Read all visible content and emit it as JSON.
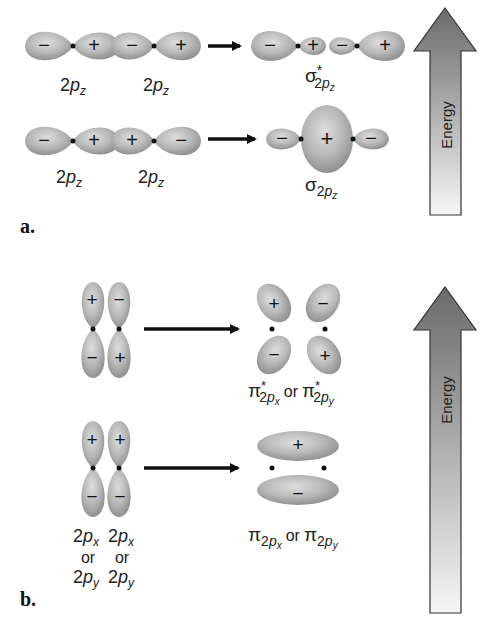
{
  "figure": {
    "colors": {
      "lobe_fill_light": "#dcdcdc",
      "lobe_fill_mid": "#b4b4b4",
      "lobe_fill_dark": "#8e8e8e",
      "nucleus": "#111111",
      "arrow": "#111111",
      "energy_top": "#6e6e6e",
      "energy_bottom": "#f4f4f4",
      "energy_outline": "#333333"
    },
    "panel_a": {
      "label": "a.",
      "antibonding": {
        "atomic_orbitals": [
          {
            "label_main": "2",
            "label_italic": "p",
            "label_sub": "z",
            "lobes": [
              "−",
              "+"
            ]
          },
          {
            "label_main": "2",
            "label_italic": "p",
            "label_sub": "z",
            "lobes": [
              "−",
              "+"
            ]
          }
        ],
        "molecular_orbital": {
          "symbol": "σ",
          "superscript": "*",
          "sub_main": "2",
          "sub_italic": "p",
          "sub_sub": "z",
          "lobes": [
            "−",
            "+",
            "−",
            "+"
          ]
        }
      },
      "bonding": {
        "atomic_orbitals": [
          {
            "label_main": "2",
            "label_italic": "p",
            "label_sub": "z",
            "lobes": [
              "−",
              "+"
            ]
          },
          {
            "label_main": "2",
            "label_italic": "p",
            "label_sub": "z",
            "lobes": [
              "+",
              "−"
            ]
          }
        ],
        "molecular_orbital": {
          "symbol": "σ",
          "sub_main": "2",
          "sub_italic": "p",
          "sub_sub": "z",
          "lobes": [
            "−",
            "+",
            "−"
          ]
        }
      },
      "energy_label": "Energy"
    },
    "panel_b": {
      "label": "b.",
      "antibonding": {
        "atomic_orbitals": [
          {
            "lobes": [
              "+",
              "−"
            ]
          },
          {
            "lobes": [
              "−",
              "+"
            ]
          }
        ],
        "molecular_orbital": {
          "symbol": "π",
          "superscript": "*",
          "lobes": [
            "+",
            "−",
            "−",
            "+"
          ],
          "label_x_sub": "2",
          "label_x_italic": "p",
          "label_x_subsub": "x",
          "connector": "or",
          "label_y_sub": "2",
          "label_y_italic": "p",
          "label_y_subsub": "y"
        }
      },
      "bonding": {
        "atomic_orbitals": [
          {
            "lobes": [
              "+",
              "−"
            ]
          },
          {
            "lobes": [
              "+",
              "−"
            ]
          }
        ],
        "atomic_labels": {
          "line1_main": "2",
          "line1_italic": "p",
          "line1_sub": "x",
          "line2": "or",
          "line3_main": "2",
          "line3_italic": "p",
          "line3_sub": "y"
        },
        "molecular_orbital": {
          "symbol": "π",
          "lobes": [
            "+",
            "−"
          ],
          "label_x_sub": "2",
          "label_x_italic": "p",
          "label_x_subsub": "x",
          "connector": "or",
          "label_y_sub": "2",
          "label_y_italic": "p",
          "label_y_subsub": "y"
        }
      },
      "energy_label": "Energy"
    }
  }
}
